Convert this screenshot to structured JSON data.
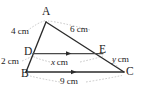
{
  "figure": {
    "stroke_color": "#2b2b2b",
    "guide_color": "#a8a8a8",
    "background_color": "#ffffff",
    "vertices": [
      {
        "name": "A",
        "label": "A",
        "x": 46,
        "y": 19
      },
      {
        "name": "B",
        "label": "B",
        "x": 26,
        "y": 74
      },
      {
        "name": "C",
        "label": "C",
        "x": 124,
        "y": 74
      },
      {
        "name": "D",
        "label": "D",
        "x": 31,
        "y": 55
      },
      {
        "name": "E",
        "label": "E",
        "x": 104,
        "y": 55
      }
    ],
    "segments": [
      {
        "name": "segment-AD",
        "from": "A",
        "to": "D",
        "measure": "4 cm"
      },
      {
        "name": "segment-AE",
        "from": "A",
        "to": "E",
        "measure": "6 cm"
      },
      {
        "name": "segment-DB",
        "from": "D",
        "to": "B",
        "measure": "2 cm"
      },
      {
        "name": "segment-DE",
        "from": "D",
        "to": "E",
        "measure": "x cm",
        "parallel_mark": true
      },
      {
        "name": "segment-EC",
        "from": "E",
        "to": "C",
        "measure": "y cm"
      },
      {
        "name": "segment-BC",
        "from": "B",
        "to": "C",
        "measure": "9 cm",
        "parallel_mark": true
      }
    ],
    "measures": {
      "ad": {
        "value": "4",
        "unit": "cm",
        "text": "4 cm"
      },
      "ae": {
        "value": "6",
        "unit": "cm",
        "text": "6 cm"
      },
      "db": {
        "value": "2",
        "unit": "cm",
        "text": "2 cm"
      },
      "de": {
        "value": "x",
        "unit": "cm",
        "text": "x cm"
      },
      "ec": {
        "value": "y",
        "unit": "cm",
        "text": "y cm"
      },
      "bc": {
        "value": "9",
        "unit": "cm",
        "text": "9 cm"
      }
    }
  }
}
